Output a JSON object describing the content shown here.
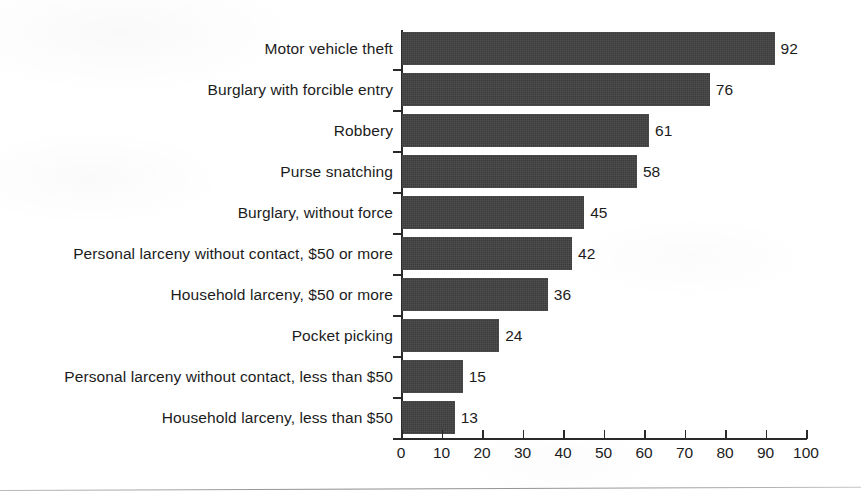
{
  "chart_data": {
    "type": "bar",
    "orientation": "horizontal",
    "title": "",
    "subtitle": "",
    "xlabel": "",
    "ylabel": "",
    "xlim": [
      0,
      100
    ],
    "grid": false,
    "legend": null,
    "x_ticks": [
      0,
      10,
      20,
      30,
      40,
      50,
      60,
      70,
      80,
      90,
      100
    ],
    "x_tick_labels": [
      "0",
      "10",
      "20",
      "30",
      "40",
      "50",
      "60",
      "70",
      "80",
      "90",
      "100"
    ],
    "categories": [
      "Motor vehicle theft",
      "Burglary with forcible entry",
      "Robbery",
      "Purse snatching",
      "Burglary, without force",
      "Personal larceny without contact, $50 or more",
      "Household larceny, $50 or more",
      "Pocket picking",
      "Personal larceny without contact, less than $50",
      "Household larceny, less than $50"
    ],
    "values": [
      92,
      76,
      61,
      58,
      45,
      42,
      36,
      24,
      15,
      13
    ],
    "value_labels": [
      "92",
      "76",
      "61",
      "58",
      "45",
      "42",
      "36",
      "24",
      "15",
      "13"
    ],
    "bar_color": "#3b3b3b",
    "axis_color": "#2a2a2a",
    "background_color": "#ffffff"
  }
}
